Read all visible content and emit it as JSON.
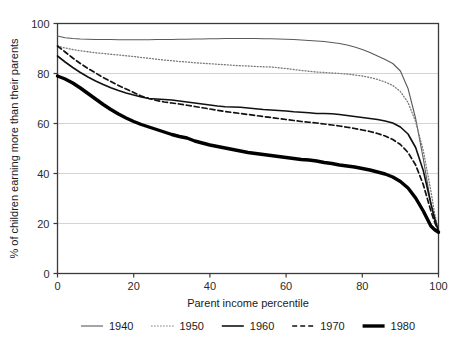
{
  "chart_data": {
    "type": "line",
    "title": "",
    "xlabel": "Parent income percentile",
    "ylabel": "% of children earning more than their parents",
    "xlim": [
      0,
      100
    ],
    "ylim": [
      0,
      100
    ],
    "xticks": [
      0,
      20,
      40,
      60,
      80,
      100
    ],
    "yticks": [
      0,
      20,
      40,
      60,
      80,
      100
    ],
    "grid": "horizontal",
    "legend_position": "bottom",
    "x": [
      0,
      2,
      4,
      6,
      8,
      10,
      12,
      14,
      16,
      18,
      20,
      22,
      24,
      26,
      28,
      30,
      32,
      34,
      36,
      38,
      40,
      42,
      44,
      46,
      48,
      50,
      52,
      54,
      56,
      58,
      60,
      62,
      64,
      66,
      68,
      70,
      72,
      74,
      76,
      78,
      80,
      82,
      84,
      86,
      88,
      90,
      92,
      94,
      96,
      98,
      99,
      100
    ],
    "series": [
      {
        "name": "1940",
        "style": "solid-thin",
        "color": "#5a5a5a",
        "values": [
          95.0,
          94.3,
          94.0,
          93.8,
          93.7,
          93.6,
          93.6,
          93.6,
          93.5,
          93.5,
          93.5,
          93.5,
          93.5,
          93.6,
          93.6,
          93.6,
          93.7,
          93.7,
          93.8,
          93.8,
          93.9,
          93.9,
          94.0,
          94.0,
          94.0,
          94.0,
          94.0,
          93.9,
          93.9,
          93.8,
          93.7,
          93.6,
          93.4,
          93.2,
          93.0,
          92.8,
          92.4,
          92.0,
          91.4,
          90.6,
          89.6,
          88.4,
          87.0,
          85.6,
          84.0,
          81.0,
          74.0,
          62.0,
          46.0,
          28.0,
          21.0,
          17.0
        ]
      },
      {
        "name": "1950",
        "style": "dotted",
        "color": "#7a7a7a",
        "values": [
          91.0,
          90.2,
          89.6,
          89.1,
          88.7,
          88.3,
          88.0,
          87.7,
          87.4,
          87.1,
          86.8,
          86.4,
          86.1,
          85.7,
          85.4,
          85.1,
          84.8,
          84.6,
          84.3,
          84.1,
          83.9,
          83.7,
          83.5,
          83.3,
          83.1,
          83.0,
          82.8,
          82.7,
          82.6,
          82.3,
          82.0,
          81.6,
          81.2,
          80.9,
          80.6,
          80.4,
          80.2,
          80.0,
          79.8,
          79.4,
          79.0,
          78.4,
          77.6,
          76.6,
          75.2,
          72.8,
          68.4,
          60.8,
          49.2,
          33.0,
          24.0,
          17.0
        ]
      },
      {
        "name": "1960",
        "style": "solid-medium",
        "color": "#111111",
        "values": [
          87.0,
          84.6,
          82.4,
          80.4,
          78.6,
          77.0,
          75.6,
          74.3,
          73.2,
          72.2,
          71.4,
          70.6,
          70.0,
          69.8,
          69.6,
          69.4,
          69.0,
          68.6,
          68.2,
          67.8,
          67.4,
          67.0,
          66.7,
          66.6,
          66.5,
          66.2,
          65.9,
          65.6,
          65.4,
          65.2,
          65.0,
          64.7,
          64.5,
          64.3,
          64.0,
          64.0,
          63.9,
          63.6,
          63.2,
          62.8,
          62.4,
          62.0,
          61.6,
          61.0,
          60.2,
          58.6,
          55.8,
          50.4,
          41.2,
          28.0,
          22.0,
          17.0
        ]
      },
      {
        "name": "1970",
        "style": "dashed",
        "color": "#111111",
        "values": [
          91.0,
          88.6,
          86.2,
          84.0,
          82.0,
          80.2,
          78.4,
          76.8,
          75.2,
          73.8,
          72.4,
          71.0,
          70.0,
          69.2,
          68.6,
          68.2,
          67.8,
          67.3,
          66.8,
          66.3,
          65.8,
          65.3,
          64.8,
          64.4,
          64.0,
          63.6,
          63.2,
          62.8,
          62.4,
          62.0,
          61.6,
          61.2,
          60.8,
          60.5,
          60.2,
          59.8,
          59.4,
          59.0,
          58.5,
          58.0,
          57.4,
          56.8,
          56.0,
          55.0,
          53.6,
          51.6,
          48.4,
          43.4,
          35.6,
          25.0,
          20.5,
          16.8
        ]
      },
      {
        "name": "1980",
        "style": "solid-thick",
        "color": "#000000",
        "values": [
          79.0,
          77.8,
          76.2,
          74.2,
          72.0,
          69.8,
          67.6,
          65.6,
          63.8,
          62.2,
          60.8,
          59.6,
          58.6,
          57.6,
          56.6,
          55.6,
          54.8,
          54.2,
          53.0,
          52.2,
          51.4,
          50.8,
          50.2,
          49.6,
          49.0,
          48.4,
          48.0,
          47.6,
          47.2,
          46.8,
          46.4,
          46.0,
          45.6,
          45.4,
          45.0,
          44.4,
          44.0,
          43.4,
          43.0,
          42.6,
          42.0,
          41.4,
          40.6,
          39.8,
          38.6,
          36.8,
          34.2,
          30.2,
          25.0,
          19.0,
          17.5,
          16.5
        ]
      }
    ]
  },
  "legend": {
    "items": [
      {
        "label": "1940"
      },
      {
        "label": "1950"
      },
      {
        "label": "1960"
      },
      {
        "label": "1970"
      },
      {
        "label": "1980"
      }
    ]
  },
  "axes": {
    "y_tick_labels": [
      "0",
      "20",
      "40",
      "60",
      "80",
      "100"
    ],
    "x_tick_labels": [
      "0",
      "20",
      "40",
      "60",
      "80",
      "100"
    ],
    "x_title": "Parent income percentile",
    "y_title": "% of children earning more than their parents"
  }
}
